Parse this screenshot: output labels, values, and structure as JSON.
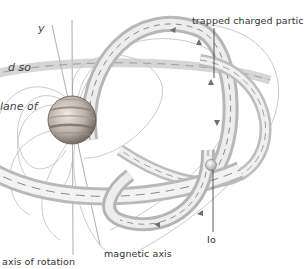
{
  "caption": {
    "lines": [
      "y",
      "d so",
      "lane of"
    ]
  },
  "labels": {
    "trapped_particles": "trapped charged particles",
    "io": "Io",
    "axis_of_rotation": "axis of rotation",
    "magnetic_axis": "magnetic axis"
  },
  "colors": {
    "background": "#ffffff",
    "line": "#9a9a9a",
    "planet_band_dark": "#6e6258",
    "planet_base": "#cfc8c0",
    "text": "#333333"
  }
}
